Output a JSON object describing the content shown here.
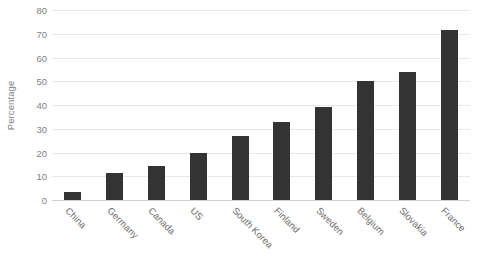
{
  "chart_data": {
    "type": "bar",
    "title": "",
    "xlabel": "",
    "ylabel": "Percentage",
    "ylim": [
      0,
      80
    ],
    "ytick_step": 10,
    "yticks": [
      80,
      70,
      60,
      50,
      40,
      30,
      20,
      10,
      0
    ],
    "grid": true,
    "legend": null,
    "bar_color": "#333333",
    "categories": [
      "China",
      "Germany",
      "Canada",
      "US",
      "South Korea",
      "Finland",
      "Sweden",
      "Belgium",
      "Slovakia",
      "France"
    ],
    "values": [
      3.5,
      11.5,
      14.3,
      20,
      27,
      33,
      39,
      50,
      54,
      71.5
    ]
  }
}
